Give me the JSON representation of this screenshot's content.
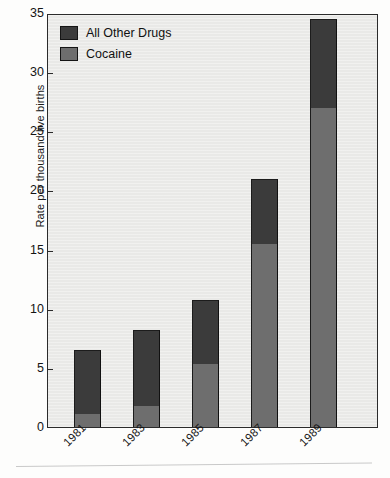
{
  "chart_data": {
    "type": "bar",
    "stacked": true,
    "title": "",
    "subtitle": "",
    "xlabel": "",
    "ylabel": "Rate per thousand live births",
    "categories": [
      "1981",
      "1983",
      "1985",
      "1987",
      "1989"
    ],
    "series": [
      {
        "name": "Cocaine",
        "color": "#6e6e6e",
        "values": [
          1.1,
          1.8,
          5.3,
          15.5,
          27.0
        ]
      },
      {
        "name": "All Other Drugs",
        "color": "#3b3b3b",
        "values": [
          5.4,
          6.4,
          5.4,
          5.5,
          7.5
        ]
      }
    ],
    "totals": [
      6.5,
      8.2,
      10.7,
      21.0,
      34.5
    ],
    "ylim": [
      0,
      35
    ],
    "yticks": [
      0,
      5,
      10,
      15,
      20,
      25,
      30,
      35
    ],
    "ytick_labels": [
      "0",
      "5",
      "10",
      "15",
      "20",
      "25",
      "30",
      "35"
    ],
    "grid": false,
    "legend_position": "top-left",
    "legend_entries": [
      "All Other Drugs",
      "Cocaine"
    ],
    "plot_background": "#e9e9e7",
    "figure_background": "#fdfdfc"
  },
  "axes": {
    "y_title": "Rate per thousand live births"
  },
  "legend": {
    "entries": [
      {
        "label": "All Other Drugs",
        "color": "#3b3b3b"
      },
      {
        "label": "Cocaine",
        "color": "#6e6e6e"
      }
    ]
  }
}
